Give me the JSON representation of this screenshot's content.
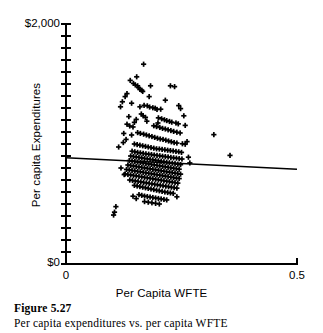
{
  "figure": {
    "caption_number": "Figure 5.27",
    "caption_text": "Per capita expenditures vs. per capita WFTE"
  },
  "chart_data": {
    "type": "scatter",
    "title": "",
    "subtitle": "",
    "xlabel": "Per Capita WFTE",
    "ylabel": "Per capita Expenditures",
    "xlim": [
      0,
      0.5
    ],
    "ylim": [
      0,
      2000
    ],
    "x_tick_labels": [
      "0",
      "0.5"
    ],
    "x_tick_values": [
      0,
      0.5
    ],
    "y_tick_labels": [
      "$0",
      "$2,000"
    ],
    "y_tick_values": [
      0,
      2000
    ],
    "y_minor_tick_count": 20,
    "grid": false,
    "legend": "none",
    "marker": "plus",
    "marker_color": "#000000",
    "axis_color": "#000000",
    "trendline": {
      "label": "least squares fit",
      "color": "#000000",
      "x_start": 0.0,
      "y_start": 885,
      "x_end": 0.5,
      "y_end": 790,
      "slope": -190,
      "intercept": 885
    },
    "points": [
      [
        0.168,
        1665
      ],
      [
        0.153,
        1560
      ],
      [
        0.139,
        1530
      ],
      [
        0.146,
        1505
      ],
      [
        0.15,
        1492
      ],
      [
        0.155,
        1485
      ],
      [
        0.157,
        1470
      ],
      [
        0.16,
        1455
      ],
      [
        0.164,
        1448
      ],
      [
        0.166,
        1438
      ],
      [
        0.183,
        1485
      ],
      [
        0.226,
        1485
      ],
      [
        0.235,
        1478
      ],
      [
        0.132,
        1420
      ],
      [
        0.128,
        1395
      ],
      [
        0.122,
        1352
      ],
      [
        0.142,
        1340
      ],
      [
        0.169,
        1322
      ],
      [
        0.176,
        1318
      ],
      [
        0.181,
        1308
      ],
      [
        0.188,
        1302
      ],
      [
        0.193,
        1298
      ],
      [
        0.197,
        1288
      ],
      [
        0.244,
        1320
      ],
      [
        0.163,
        1250
      ],
      [
        0.167,
        1235
      ],
      [
        0.172,
        1222
      ],
      [
        0.152,
        1205
      ],
      [
        0.2,
        1218
      ],
      [
        0.207,
        1210
      ],
      [
        0.213,
        1202
      ],
      [
        0.218,
        1195
      ],
      [
        0.224,
        1188
      ],
      [
        0.229,
        1182
      ],
      [
        0.238,
        1175
      ],
      [
        0.243,
        1168
      ],
      [
        0.132,
        1165
      ],
      [
        0.138,
        1150
      ],
      [
        0.145,
        1142
      ],
      [
        0.19,
        1152
      ],
      [
        0.196,
        1145
      ],
      [
        0.203,
        1138
      ],
      [
        0.209,
        1130
      ],
      [
        0.215,
        1125
      ],
      [
        0.221,
        1118
      ],
      [
        0.227,
        1112
      ],
      [
        0.233,
        1105
      ],
      [
        0.24,
        1098
      ],
      [
        0.247,
        1092
      ],
      [
        0.125,
        1088
      ],
      [
        0.155,
        1095
      ],
      [
        0.161,
        1088
      ],
      [
        0.168,
        1082
      ],
      [
        0.174,
        1075
      ],
      [
        0.18,
        1068
      ],
      [
        0.186,
        1062
      ],
      [
        0.192,
        1055
      ],
      [
        0.198,
        1048
      ],
      [
        0.204,
        1042
      ],
      [
        0.21,
        1038
      ],
      [
        0.216,
        1032
      ],
      [
        0.222,
        1025
      ],
      [
        0.228,
        1018
      ],
      [
        0.234,
        1012
      ],
      [
        0.24,
        1008
      ],
      [
        0.252,
        1002
      ],
      [
        0.258,
        998
      ],
      [
        0.148,
        1000
      ],
      [
        0.154,
        995
      ],
      [
        0.16,
        990
      ],
      [
        0.166,
        985
      ],
      [
        0.172,
        980
      ],
      [
        0.178,
        975
      ],
      [
        0.184,
        970
      ],
      [
        0.19,
        965
      ],
      [
        0.196,
        960
      ],
      [
        0.202,
        958
      ],
      [
        0.208,
        955
      ],
      [
        0.214,
        952
      ],
      [
        0.22,
        948
      ],
      [
        0.226,
        945
      ],
      [
        0.232,
        942
      ],
      [
        0.238,
        938
      ],
      [
        0.244,
        935
      ],
      [
        0.25,
        930
      ],
      [
        0.143,
        940
      ],
      [
        0.149,
        935
      ],
      [
        0.155,
        930
      ],
      [
        0.161,
        926
      ],
      [
        0.167,
        922
      ],
      [
        0.173,
        918
      ],
      [
        0.179,
        915
      ],
      [
        0.185,
        912
      ],
      [
        0.191,
        908
      ],
      [
        0.197,
        905
      ],
      [
        0.203,
        902
      ],
      [
        0.209,
        898
      ],
      [
        0.215,
        895
      ],
      [
        0.221,
        892
      ],
      [
        0.227,
        888
      ],
      [
        0.233,
        885
      ],
      [
        0.239,
        882
      ],
      [
        0.245,
        878
      ],
      [
        0.251,
        875
      ],
      [
        0.14,
        900
      ],
      [
        0.146,
        896
      ],
      [
        0.152,
        892
      ],
      [
        0.158,
        888
      ],
      [
        0.164,
        884
      ],
      [
        0.17,
        880
      ],
      [
        0.176,
        876
      ],
      [
        0.182,
        872
      ],
      [
        0.188,
        868
      ],
      [
        0.194,
        864
      ],
      [
        0.2,
        860
      ],
      [
        0.206,
        856
      ],
      [
        0.212,
        852
      ],
      [
        0.218,
        848
      ],
      [
        0.224,
        844
      ],
      [
        0.23,
        840
      ],
      [
        0.236,
        836
      ],
      [
        0.242,
        832
      ],
      [
        0.248,
        828
      ],
      [
        0.137,
        862
      ],
      [
        0.143,
        858
      ],
      [
        0.149,
        854
      ],
      [
        0.155,
        850
      ],
      [
        0.161,
        846
      ],
      [
        0.167,
        842
      ],
      [
        0.173,
        838
      ],
      [
        0.179,
        834
      ],
      [
        0.185,
        830
      ],
      [
        0.191,
        826
      ],
      [
        0.197,
        822
      ],
      [
        0.203,
        818
      ],
      [
        0.209,
        814
      ],
      [
        0.215,
        810
      ],
      [
        0.221,
        806
      ],
      [
        0.227,
        802
      ],
      [
        0.233,
        798
      ],
      [
        0.239,
        794
      ],
      [
        0.245,
        790
      ],
      [
        0.134,
        825
      ],
      [
        0.14,
        821
      ],
      [
        0.146,
        817
      ],
      [
        0.152,
        813
      ],
      [
        0.158,
        809
      ],
      [
        0.164,
        805
      ],
      [
        0.17,
        801
      ],
      [
        0.176,
        797
      ],
      [
        0.182,
        793
      ],
      [
        0.188,
        789
      ],
      [
        0.194,
        785
      ],
      [
        0.2,
        781
      ],
      [
        0.206,
        777
      ],
      [
        0.212,
        773
      ],
      [
        0.218,
        769
      ],
      [
        0.224,
        765
      ],
      [
        0.23,
        761
      ],
      [
        0.236,
        757
      ],
      [
        0.242,
        753
      ],
      [
        0.248,
        749
      ],
      [
        0.131,
        788
      ],
      [
        0.137,
        784
      ],
      [
        0.143,
        780
      ],
      [
        0.149,
        776
      ],
      [
        0.155,
        772
      ],
      [
        0.161,
        768
      ],
      [
        0.167,
        764
      ],
      [
        0.173,
        760
      ],
      [
        0.179,
        756
      ],
      [
        0.185,
        752
      ],
      [
        0.191,
        748
      ],
      [
        0.197,
        744
      ],
      [
        0.203,
        740
      ],
      [
        0.209,
        736
      ],
      [
        0.215,
        732
      ],
      [
        0.221,
        728
      ],
      [
        0.227,
        724
      ],
      [
        0.233,
        720
      ],
      [
        0.239,
        716
      ],
      [
        0.245,
        712
      ],
      [
        0.128,
        750
      ],
      [
        0.134,
        746
      ],
      [
        0.14,
        742
      ],
      [
        0.146,
        738
      ],
      [
        0.152,
        734
      ],
      [
        0.158,
        730
      ],
      [
        0.164,
        726
      ],
      [
        0.17,
        722
      ],
      [
        0.176,
        718
      ],
      [
        0.182,
        714
      ],
      [
        0.188,
        710
      ],
      [
        0.194,
        706
      ],
      [
        0.2,
        702
      ],
      [
        0.206,
        698
      ],
      [
        0.212,
        694
      ],
      [
        0.218,
        690
      ],
      [
        0.224,
        686
      ],
      [
        0.23,
        682
      ],
      [
        0.236,
        678
      ],
      [
        0.242,
        674
      ],
      [
        0.138,
        700
      ],
      [
        0.144,
        696
      ],
      [
        0.15,
        692
      ],
      [
        0.156,
        688
      ],
      [
        0.162,
        684
      ],
      [
        0.168,
        680
      ],
      [
        0.174,
        676
      ],
      [
        0.18,
        672
      ],
      [
        0.186,
        668
      ],
      [
        0.192,
        664
      ],
      [
        0.198,
        660
      ],
      [
        0.204,
        656
      ],
      [
        0.21,
        652
      ],
      [
        0.216,
        648
      ],
      [
        0.222,
        644
      ],
      [
        0.228,
        640
      ],
      [
        0.234,
        636
      ],
      [
        0.24,
        632
      ],
      [
        0.148,
        655
      ],
      [
        0.154,
        650
      ],
      [
        0.16,
        645
      ],
      [
        0.166,
        640
      ],
      [
        0.172,
        635
      ],
      [
        0.178,
        630
      ],
      [
        0.184,
        625
      ],
      [
        0.19,
        620
      ],
      [
        0.196,
        615
      ],
      [
        0.202,
        610
      ],
      [
        0.208,
        605
      ],
      [
        0.214,
        600
      ],
      [
        0.22,
        596
      ],
      [
        0.226,
        592
      ],
      [
        0.232,
        588
      ],
      [
        0.158,
        578
      ],
      [
        0.164,
        572
      ],
      [
        0.17,
        566
      ],
      [
        0.176,
        562
      ],
      [
        0.182,
        558
      ],
      [
        0.188,
        554
      ],
      [
        0.194,
        550
      ],
      [
        0.2,
        546
      ],
      [
        0.206,
        542
      ],
      [
        0.212,
        538
      ],
      [
        0.218,
        534
      ],
      [
        0.17,
        520
      ],
      [
        0.178,
        515
      ],
      [
        0.186,
        510
      ],
      [
        0.194,
        505
      ],
      [
        0.202,
        500
      ],
      [
        0.152,
        545
      ],
      [
        0.145,
        565
      ],
      [
        0.24,
        560
      ],
      [
        0.114,
        975
      ],
      [
        0.119,
        800
      ],
      [
        0.126,
        745
      ],
      [
        0.108,
        478
      ],
      [
        0.105,
        432
      ],
      [
        0.103,
        408
      ],
      [
        0.32,
        1078
      ],
      [
        0.355,
        905
      ],
      [
        0.258,
        1155
      ],
      [
        0.262,
        1020
      ],
      [
        0.265,
        890
      ],
      [
        0.268,
        842
      ],
      [
        0.255,
        1235
      ],
      [
        0.248,
        1295
      ],
      [
        0.142,
        1075
      ],
      [
        0.148,
        1180
      ],
      [
        0.136,
        1228
      ],
      [
        0.118,
        1310
      ],
      [
        0.13,
        1038
      ],
      [
        0.124,
        1012
      ],
      [
        0.18,
        1395
      ],
      [
        0.215,
        1365
      ],
      [
        0.205,
        1290
      ],
      [
        0.199,
        1175
      ],
      [
        0.175,
        1190
      ],
      [
        0.16,
        1310
      ]
    ]
  }
}
